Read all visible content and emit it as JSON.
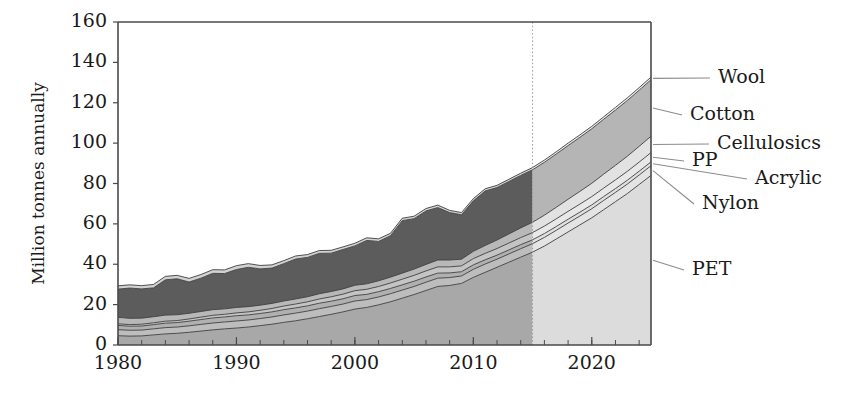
{
  "chart_data": {
    "type": "area",
    "title": "",
    "subtitle": "",
    "xlabel": "",
    "ylabel": "Million tonnes annually",
    "xlim": [
      1980,
      2025
    ],
    "ylim": [
      0,
      160
    ],
    "grid": false,
    "stacked": true,
    "legend_position": "right-inline-labels",
    "x_ticks": [
      1980,
      1990,
      2000,
      2010,
      2020
    ],
    "x_tick_labels": [
      "1980",
      "1990",
      "2000",
      "2010",
      "2020"
    ],
    "x_minor_tick_interval": 2,
    "y_ticks": [
      0,
      20,
      40,
      60,
      80,
      100,
      120,
      140,
      160
    ],
    "y_tick_labels": [
      "0",
      "20",
      "40",
      "60",
      "80",
      "100",
      "120",
      "140",
      "160"
    ],
    "forecast_start_year": 2015,
    "annotations": [
      {
        "text": "Forecast region shading begins 2015",
        "visible": false
      }
    ],
    "x": [
      1980,
      1981,
      1982,
      1983,
      1984,
      1985,
      1986,
      1987,
      1988,
      1989,
      1990,
      1991,
      1992,
      1993,
      1994,
      1995,
      1996,
      1997,
      1998,
      1999,
      2000,
      2001,
      2002,
      2003,
      2004,
      2005,
      2006,
      2007,
      2008,
      2009,
      2010,
      2011,
      2012,
      2013,
      2014,
      2015,
      2016,
      2017,
      2018,
      2019,
      2020,
      2021,
      2022,
      2023,
      2024,
      2025
    ],
    "series": [
      {
        "name": "PET",
        "order": 1,
        "color_historic": "#a8a8a8",
        "color_forecast": "#dcdcdc",
        "values": [
          4.6,
          4.4,
          4.5,
          5.0,
          5.5,
          5.8,
          6.3,
          6.9,
          7.5,
          8.0,
          8.4,
          8.9,
          9.6,
          10.3,
          11.2,
          12.0,
          13.0,
          14.1,
          15.2,
          16.4,
          17.8,
          18.6,
          19.9,
          21.4,
          23.2,
          25.0,
          27.0,
          29.0,
          29.5,
          30.5,
          33.5,
          36.0,
          38.5,
          41.0,
          43.5,
          46.0,
          49.0,
          52.5,
          56.0,
          59.5,
          63.0,
          67.0,
          71.0,
          75.0,
          79.5,
          84.0
        ]
      },
      {
        "name": "Nylon",
        "order": 2,
        "color_historic": "#bdbdbd",
        "color_forecast": "#e4e4e4",
        "values": [
          3.0,
          2.9,
          2.9,
          3.0,
          3.1,
          3.1,
          3.2,
          3.3,
          3.4,
          3.4,
          3.5,
          3.5,
          3.5,
          3.6,
          3.7,
          3.8,
          3.8,
          3.9,
          3.9,
          3.9,
          4.0,
          3.9,
          3.9,
          4.0,
          4.0,
          4.0,
          4.1,
          4.1,
          3.9,
          3.7,
          4.0,
          4.1,
          4.0,
          4.1,
          4.2,
          4.2,
          4.3,
          4.3,
          4.4,
          4.4,
          4.5,
          4.6,
          4.6,
          4.7,
          4.7,
          4.8
        ]
      },
      {
        "name": "Acrylic",
        "order": 3,
        "color_historic": "#b0b0b0",
        "color_forecast": "#e0e0e0",
        "values": [
          2.1,
          2.0,
          2.0,
          2.1,
          2.2,
          2.2,
          2.3,
          2.4,
          2.5,
          2.5,
          2.6,
          2.5,
          2.5,
          2.5,
          2.6,
          2.6,
          2.6,
          2.7,
          2.6,
          2.6,
          2.7,
          2.6,
          2.6,
          2.6,
          2.6,
          2.6,
          2.6,
          2.5,
          2.3,
          2.1,
          2.2,
          2.1,
          2.0,
          2.0,
          2.0,
          1.9,
          1.9,
          1.9,
          1.9,
          1.9,
          1.9,
          1.9,
          1.9,
          1.9,
          1.9,
          1.9
        ]
      },
      {
        "name": "PP",
        "order": 4,
        "color_historic": "#c4c4c4",
        "color_forecast": "#e8e8e8",
        "values": [
          0.8,
          0.8,
          0.9,
          0.9,
          1.0,
          1.0,
          1.1,
          1.2,
          1.3,
          1.3,
          1.4,
          1.5,
          1.6,
          1.7,
          1.8,
          1.9,
          2.0,
          2.1,
          2.2,
          2.3,
          2.4,
          2.5,
          2.6,
          2.7,
          2.8,
          2.9,
          3.0,
          3.1,
          3.0,
          2.9,
          3.1,
          3.2,
          3.3,
          3.4,
          3.5,
          3.6,
          3.7,
          3.8,
          3.9,
          4.0,
          4.1,
          4.2,
          4.3,
          4.4,
          4.5,
          4.6
        ]
      },
      {
        "name": "Cellulosics",
        "order": 5,
        "color_historic": "#b8b8b8",
        "color_forecast": "#e2e2e2",
        "values": [
          3.2,
          3.1,
          3.0,
          3.0,
          3.0,
          2.9,
          2.8,
          2.8,
          2.8,
          2.7,
          2.7,
          2.6,
          2.5,
          2.5,
          2.5,
          2.5,
          2.5,
          2.6,
          2.6,
          2.6,
          2.7,
          2.7,
          2.8,
          2.9,
          3.0,
          3.1,
          3.2,
          3.4,
          3.4,
          3.3,
          3.6,
          3.9,
          4.2,
          4.5,
          4.8,
          5.1,
          5.4,
          5.7,
          6.0,
          6.3,
          6.6,
          6.9,
          7.2,
          7.5,
          7.8,
          8.1
        ]
      },
      {
        "name": "Cotton",
        "order": 6,
        "color_historic": "#5c5c5c",
        "color_forecast": "#b5b5b5",
        "values": [
          14.0,
          15.0,
          14.5,
          14.3,
          17.5,
          17.8,
          15.5,
          16.5,
          18.0,
          17.5,
          18.8,
          19.5,
          18.0,
          17.5,
          18.5,
          19.8,
          19.5,
          20.0,
          19.0,
          19.5,
          19.5,
          21.5,
          19.5,
          20.5,
          26.0,
          25.0,
          26.5,
          26.0,
          23.5,
          22.0,
          25.0,
          27.0,
          26.0,
          26.0,
          26.0,
          26.0,
          26.2,
          26.4,
          26.6,
          26.8,
          27.0,
          27.2,
          27.4,
          27.6,
          27.8,
          28.0
        ]
      },
      {
        "name": "Wool",
        "order": 7,
        "color_historic": "#d2d2d2",
        "color_forecast": "#ececec",
        "values": [
          1.6,
          1.6,
          1.6,
          1.7,
          1.7,
          1.7,
          1.8,
          1.8,
          1.8,
          1.8,
          1.9,
          1.8,
          1.7,
          1.6,
          1.5,
          1.5,
          1.4,
          1.4,
          1.4,
          1.3,
          1.3,
          1.3,
          1.3,
          1.2,
          1.2,
          1.2,
          1.2,
          1.2,
          1.1,
          1.1,
          1.1,
          1.1,
          1.1,
          1.1,
          1.1,
          1.1,
          1.1,
          1.1,
          1.2,
          1.2,
          1.2,
          1.2,
          1.3,
          1.3,
          1.3,
          1.3
        ]
      }
    ],
    "label_callouts": [
      {
        "name": "Wool",
        "text": "Wool",
        "label_x": 718,
        "label_y": 78
      },
      {
        "name": "Cotton",
        "text": "Cotton",
        "label_x": 690,
        "label_y": 115
      },
      {
        "name": "Cellulosics",
        "text": "Cellulosics",
        "label_x": 717,
        "label_y": 144
      },
      {
        "name": "PP",
        "text": "PP",
        "label_x": 692,
        "label_y": 161
      },
      {
        "name": "Acrylic",
        "text": "Acrylic",
        "label_x": 755,
        "label_y": 179
      },
      {
        "name": "Nylon",
        "text": "Nylon",
        "label_x": 702,
        "label_y": 204
      },
      {
        "name": "PET",
        "text": "PET",
        "label_x": 692,
        "label_y": 270
      }
    ]
  }
}
